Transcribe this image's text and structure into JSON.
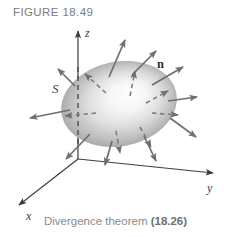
{
  "figure": {
    "number_label": "FIGURE 18.49",
    "caption_text": "Divergence theorem ",
    "caption_reference": "(18.26)"
  },
  "diagram": {
    "type": "3d-vector-field-diagram",
    "axes": [
      {
        "name": "z-axis",
        "label": "z",
        "label_x": 88,
        "label_y": 35,
        "from": [
          78,
          159
        ],
        "to": [
          78,
          29
        ],
        "direction": "up"
      },
      {
        "name": "y-axis",
        "label": "y",
        "label_x": 211,
        "label_y": 190,
        "from": [
          78,
          159
        ],
        "to": [
          216,
          173
        ],
        "direction": "right-down"
      },
      {
        "name": "x-axis",
        "label": "x",
        "label_x": 29,
        "label_y": 216,
        "from": [
          78,
          159
        ],
        "to": [
          16,
          207
        ],
        "direction": "left-down"
      }
    ],
    "surface": {
      "label": "S",
      "label_x": 54,
      "label_y": 92,
      "shape": "ellipsoid",
      "center_x": 119,
      "center_y": 104,
      "radius_x": 58,
      "radius_y": 42,
      "rotation_deg": -11,
      "fill_center_color": "#fdfdfd",
      "fill_edge_color": "#9b9b9b",
      "highlight_x": 132,
      "highlight_y": 96
    },
    "normal_vector": {
      "label": "n",
      "label_x": 160,
      "label_y": 66
    },
    "hidden_axis_segment": {
      "name": "z-axis-hidden",
      "style": "dashed",
      "from": [
        78,
        66
      ],
      "to": [
        78,
        146
      ]
    },
    "normal_arrows": [
      {
        "id": 1,
        "x1": 109,
        "y1": 77,
        "x2": 127,
        "y2": 36,
        "style": "solid"
      },
      {
        "id": 2,
        "x1": 132,
        "y1": 75,
        "x2": 158,
        "y2": 48,
        "style": "solid"
      },
      {
        "id": 3,
        "x1": 152,
        "y1": 85,
        "x2": 186,
        "y2": 65,
        "style": "solid"
      },
      {
        "id": 4,
        "x1": 168,
        "y1": 101,
        "x2": 200,
        "y2": 96,
        "style": "solid"
      },
      {
        "id": 5,
        "x1": 170,
        "y1": 118,
        "x2": 199,
        "y2": 139,
        "style": "solid"
      },
      {
        "id": 6,
        "x1": 144,
        "y1": 136,
        "x2": 157,
        "y2": 164,
        "style": "solid"
      },
      {
        "id": 7,
        "x1": 112,
        "y1": 141,
        "x2": 104,
        "y2": 168,
        "style": "solid"
      },
      {
        "id": 8,
        "x1": 90,
        "y1": 134,
        "x2": 63,
        "y2": 162,
        "style": "solid"
      },
      {
        "id": 9,
        "x1": 70,
        "y1": 110,
        "x2": 27,
        "y2": 119,
        "style": "solid"
      },
      {
        "id": 10,
        "x1": 75,
        "y1": 86,
        "x2": 56,
        "y2": 67,
        "style": "solid"
      },
      {
        "id": 11,
        "x1": 106,
        "y1": 93,
        "x2": 82,
        "y2": 72,
        "style": "dashed"
      },
      {
        "id": 12,
        "x1": 130,
        "y1": 96,
        "x2": 136,
        "y2": 68,
        "style": "dashed"
      },
      {
        "id": 13,
        "x1": 146,
        "y1": 103,
        "x2": 170,
        "y2": 90,
        "style": "dashed"
      },
      {
        "id": 14,
        "x1": 152,
        "y1": 113,
        "x2": 180,
        "y2": 115,
        "style": "dashed"
      },
      {
        "id": 15,
        "x1": 140,
        "y1": 127,
        "x2": 152,
        "y2": 150,
        "style": "dashed"
      },
      {
        "id": 16,
        "x1": 116,
        "y1": 131,
        "x2": 120,
        "y2": 156,
        "style": "dashed"
      },
      {
        "id": 17,
        "x1": 96,
        "y1": 113,
        "x2": 62,
        "y2": 116,
        "style": "dashed"
      }
    ],
    "colors": {
      "arrow": "#6e6e74",
      "axis": "#3d3d3d",
      "label": "#3a3a3a",
      "caption": "#8a8a8a"
    }
  }
}
